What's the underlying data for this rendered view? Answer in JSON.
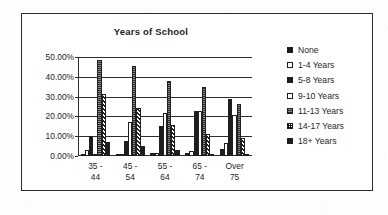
{
  "chart_data": {
    "type": "bar",
    "title": "Years of School",
    "xlabel": "",
    "ylabel": "",
    "ylim": [
      0,
      50
    ],
    "grid": true,
    "legend_position": "right",
    "ytick_labels": [
      "50.00%",
      "40.00%",
      "30.00%",
      "20.00%",
      "10.00%",
      "0.00%"
    ],
    "ytick_values": [
      50,
      40,
      30,
      20,
      10,
      0
    ],
    "categories": [
      "35 - 44",
      "45 - 54",
      "55 - 64",
      "65 - 74",
      "Over 75"
    ],
    "category_lines": [
      [
        "35 -",
        "44"
      ],
      [
        "45 -",
        "54"
      ],
      [
        "55 -",
        "64"
      ],
      [
        "65 -",
        "74"
      ],
      [
        "Over",
        "75"
      ]
    ],
    "series": [
      {
        "name": "None",
        "fill": "solid",
        "values": [
          0.5,
          1.0,
          1.5,
          1.5,
          3.5
        ]
      },
      {
        "name": "1-4 Years",
        "fill": "white",
        "values": [
          3.0,
          1.0,
          1.5,
          2.5,
          6.5
        ]
      },
      {
        "name": "5-8 Years",
        "fill": "solid",
        "values": [
          10.0,
          7.5,
          15.0,
          22.5,
          29.0
        ]
      },
      {
        "name": "9-10 Years",
        "fill": "white",
        "values": [
          1.0,
          17.0,
          21.5,
          22.5,
          20.5
        ]
      },
      {
        "name": "11-13 Years",
        "fill": "gray",
        "values": [
          48.5,
          45.5,
          38.0,
          35.0,
          26.5
        ]
      },
      {
        "name": "14-17 Years",
        "fill": "diag",
        "values": [
          31.5,
          24.0,
          15.5,
          11.0,
          9.0
        ]
      },
      {
        "name": "18+ Years",
        "fill": "solid",
        "values": [
          7.0,
          5.0,
          3.0,
          1.0,
          1.0
        ]
      }
    ]
  },
  "legend": {
    "items": [
      {
        "label": "None",
        "swatch": "solid"
      },
      {
        "label": "1-4 Years",
        "swatch": "white"
      },
      {
        "label": "5-8 Years",
        "swatch": "solid"
      },
      {
        "label": "9-10 Years",
        "swatch": "white"
      },
      {
        "label": "11-13 Years",
        "swatch": "gray"
      },
      {
        "label": "14-17 Years",
        "swatch": "check"
      },
      {
        "label": "18+ Years",
        "swatch": "solid"
      }
    ]
  },
  "colors": {
    "ink": "#1f1f1f",
    "axis": "#2e2e2e",
    "paper": "#ffffff"
  }
}
